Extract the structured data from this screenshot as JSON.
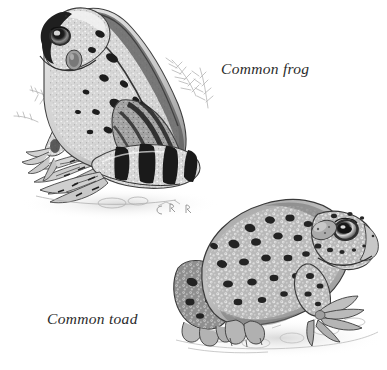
{
  "plate": {
    "kind": "natural-history-illustration",
    "medium": "monochrome stipple and line engraving",
    "background_color": "#ffffff",
    "ink_color": "#2b2b2b",
    "width": 387,
    "height": 370
  },
  "captions": {
    "frog": "Common frog",
    "toad": "Common toad"
  },
  "figures": [
    {
      "id": "frog",
      "label": "Common frog",
      "position": "upper-left",
      "facing": "left",
      "pose": "sitting upright on haunches in profile",
      "bounds": {
        "x": 8,
        "y": 4,
        "width": 220,
        "height": 215
      },
      "features": [
        "large round eye with dark pupil and pale iris ring",
        "circular tympanum behind eye",
        "dark mask stripe through eye",
        "dorsolateral ridge along back",
        "smooth stippled skin with dark irregular blotches",
        "strongly banded hind leg with dark cross bars",
        "long webbed hind foot extended forward",
        "slender front limb with spread digits",
        "fern-like background vegetation behind back",
        "faint ground shadow beneath body",
        "small artist monogram near lower right of figure"
      ],
      "tones": {
        "body_light": "#d9d9d9",
        "body_mid": "#9a9a9a",
        "markings": "#1e1e1e"
      }
    },
    {
      "id": "toad",
      "label": "Common toad",
      "position": "lower-right",
      "facing": "right",
      "pose": "squat crouching stance on stony ground",
      "bounds": {
        "x": 176,
        "y": 180,
        "width": 205,
        "height": 175
      },
      "features": [
        "broad flat head with blunt snout",
        "prominent eye with horizontal pupil and pale iris",
        "raised paratoid gland behind eye",
        "heavily warty tuberculate skin covered in pale stipple",
        "rows of dark warts along the back and flanks",
        "thick muscular hind limb folded against body",
        "unwebbed front foot with splayed blunt toes",
        "stony pebbled ground with cast shadow"
      ],
      "tones": {
        "body_light": "#cfcfcf",
        "body_mid": "#8d8d8d",
        "markings": "#242424"
      }
    }
  ],
  "artist_mark": {
    "present": true,
    "description": "faint monogram beneath the frog"
  }
}
